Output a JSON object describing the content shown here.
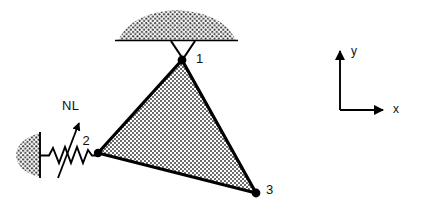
{
  "figure": {
    "background_color": "#ffffff",
    "line_color": "#000000",
    "fill_pattern_color": "#333333"
  },
  "nodes": [
    {
      "id": "1",
      "label": "1",
      "x": 182,
      "y": 60,
      "label_x": 196,
      "label_y": 63
    },
    {
      "id": "2",
      "label": "2",
      "x": 98,
      "y": 153,
      "label_x": 86,
      "label_y": 145
    },
    {
      "id": "3",
      "label": "3",
      "x": 256,
      "y": 193,
      "label_x": 266,
      "label_y": 194
    }
  ],
  "element": {
    "name": "triangular-element",
    "fill": "dotted-hatch"
  },
  "supports": {
    "top": {
      "name": "pin-support-top",
      "line_x1": 115,
      "line_x2": 238,
      "line_y": 40,
      "hatch": "dome-dotted"
    },
    "left": {
      "name": "wall-support-left",
      "line_x": 40,
      "line_y1": 132,
      "line_y2": 178,
      "hatch": "half-ellipse-dotted"
    }
  },
  "spring": {
    "name": "nonlinear-spring",
    "x_start": 40,
    "x_end": 98,
    "y": 155,
    "coils": 4
  },
  "force": {
    "label": "NL",
    "label_x": 62,
    "label_y": 110,
    "arrow_from_x": 58,
    "arrow_from_y": 176,
    "arrow_to_x": 79,
    "arrow_to_y": 123
  },
  "axes": {
    "origin_x": 340,
    "origin_y": 110,
    "y_axis": {
      "label": "y",
      "tip_y": 48,
      "label_x": 351,
      "label_y": 55
    },
    "x_axis": {
      "label": "x",
      "tip_x": 386,
      "label_x": 393,
      "label_y": 113
    }
  }
}
